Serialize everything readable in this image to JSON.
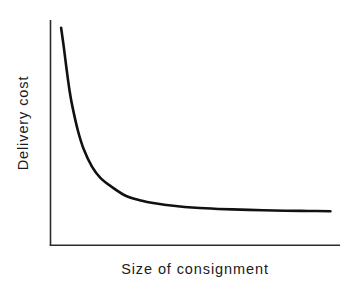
{
  "chart_data": {
    "type": "line",
    "title": "",
    "subtitle": "",
    "xlabel": "Size of consignment",
    "ylabel": "Delivery cost",
    "grid": false,
    "legend": null,
    "annotations": [],
    "axis_style": {
      "spines": [
        "left",
        "bottom"
      ],
      "ticks": "none",
      "tick_labels": "none",
      "xlim": [
        0,
        100
      ],
      "ylim": [
        0,
        100
      ]
    },
    "series": [
      {
        "name": "Delivery cost per unit",
        "shape": "decreasing convex asymptotic curve",
        "color": "#111111",
        "line_width": 2.6,
        "x": [
          2,
          3,
          4,
          5,
          6,
          8,
          10,
          13,
          16,
          20,
          25,
          30,
          36,
          42,
          50,
          58,
          66,
          74,
          82,
          90,
          98
        ],
        "y": [
          97,
          88,
          78,
          69,
          62,
          51,
          43,
          35,
          30,
          26,
          22,
          20,
          18.5,
          17.5,
          16.6,
          16.1,
          15.8,
          15.5,
          15.3,
          15.2,
          15.1
        ]
      }
    ]
  },
  "labels": {
    "y_axis_title": "Delivery cost",
    "x_axis_title": "Size of consignment"
  },
  "colors": {
    "background": "#ffffff",
    "curve": "#111111",
    "axis": "#2b2b2b",
    "text": "#1b1b1b"
  }
}
